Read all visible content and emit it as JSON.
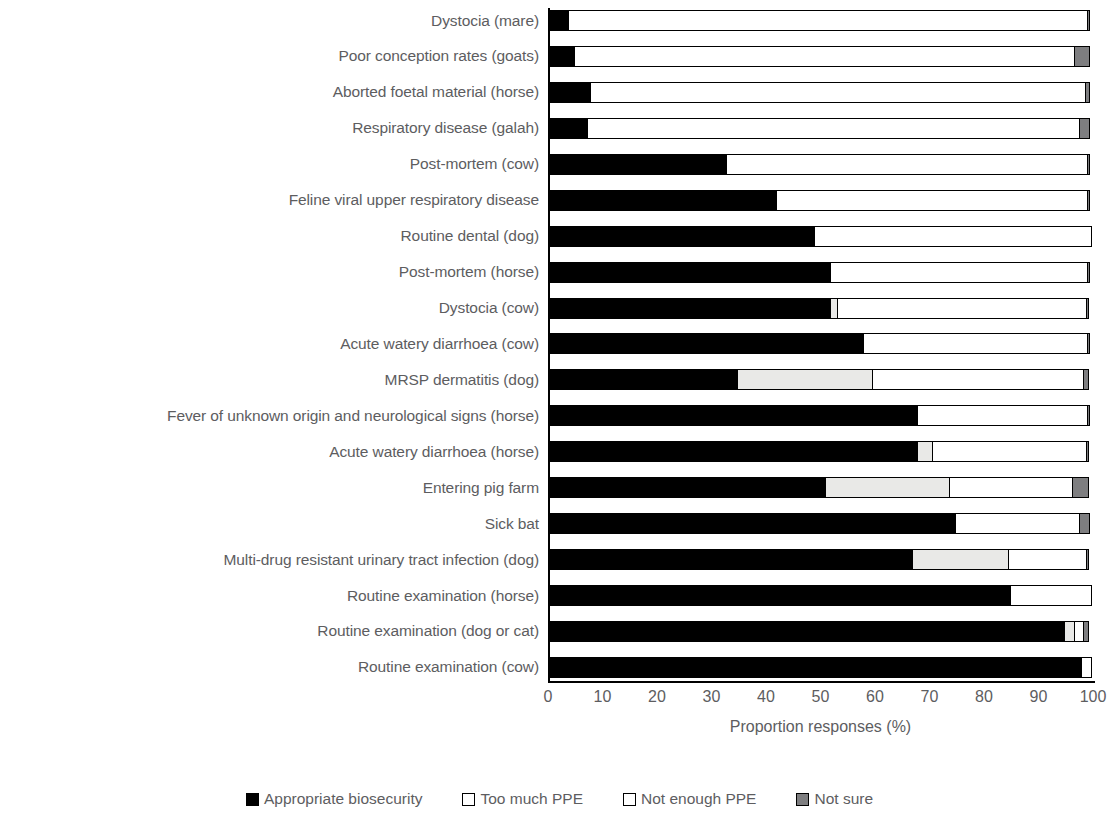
{
  "chart_data": {
    "type": "bar",
    "orientation": "horizontal",
    "stacked": true,
    "stack_mode": "percent",
    "title": "",
    "xlabel": "Proportion responses (%)",
    "ylabel": "",
    "xlim": [
      0,
      100
    ],
    "xticks": [
      0,
      10,
      20,
      30,
      40,
      50,
      60,
      70,
      80,
      90,
      100
    ],
    "grid": false,
    "legend_position": "bottom",
    "legend": [
      "Appropriate biosecurity",
      "Too much PPE",
      "Not enough PPE",
      "Not sure"
    ],
    "colors": {
      "Appropriate biosecurity": "#000000",
      "Too much PPE": "#e9e9e7",
      "Not enough PPE": "#ffffff",
      "Not sure": "#7e7e80"
    },
    "categories": [
      "Dystocia (mare)",
      "Poor conception rates (goats)",
      "Aborted foetal material (horse)",
      "Respiratory disease (galah)",
      "Post-mortem (cow)",
      "Feline viral upper respiratory disease",
      "Routine dental (dog)",
      "Post-mortem (horse)",
      "Dystocia (cow)",
      "Acute watery diarrhoea (cow)",
      "MRSP dermatitis (dog)",
      "Fever of unknown origin and neurological signs (horse)",
      "Acute watery diarrhoea (horse)",
      "Entering pig farm",
      "Sick bat",
      "Multi-drug resistant urinary tract infection (dog)",
      "Routine examination (horse)",
      "Routine examination (dog or cat)",
      "Routine examination (cow)"
    ],
    "series": [
      {
        "name": "Appropriate biosecurity",
        "values": [
          4,
          5,
          8,
          7.5,
          33,
          42,
          49,
          52,
          52,
          58,
          35,
          68,
          68,
          51,
          75,
          67,
          85,
          95,
          98
        ]
      },
      {
        "name": "Too much PPE",
        "values": [
          0,
          0,
          0,
          0,
          0,
          0,
          0,
          0,
          1.5,
          0,
          25,
          0,
          3,
          23,
          0,
          18,
          0,
          2,
          0
        ]
      },
      {
        "name": "Not enough PPE",
        "values": [
          95.5,
          92,
          91,
          90.5,
          66.5,
          57.5,
          51,
          47.5,
          46,
          41.5,
          39,
          31.5,
          28.5,
          23,
          23,
          14.5,
          15,
          2,
          2
        ]
      },
      {
        "name": "Not sure",
        "values": [
          0.5,
          3,
          1,
          2,
          0.5,
          0.5,
          0,
          0.5,
          0.5,
          0.5,
          1,
          0.5,
          0.5,
          3,
          2,
          0.5,
          0,
          1,
          0
        ]
      }
    ]
  },
  "axis": {
    "x_title": "Proportion responses (%)",
    "x_tick_labels": [
      "0",
      "10",
      "20",
      "30",
      "40",
      "50",
      "60",
      "70",
      "80",
      "90",
      "100"
    ]
  },
  "legend": {
    "items": [
      {
        "label": "Appropriate biosecurity",
        "swatch": "solid-black-square-icon"
      },
      {
        "label": "Too much PPE",
        "swatch": "outline-square-icon"
      },
      {
        "label": "Not enough PPE",
        "swatch": "outline-square-icon"
      },
      {
        "label": "Not sure",
        "swatch": "grey-square-icon"
      }
    ]
  }
}
